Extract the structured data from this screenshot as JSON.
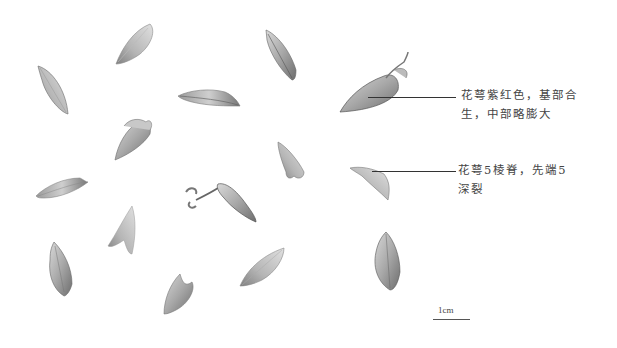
{
  "figure": {
    "annotations": [
      {
        "id": "a1",
        "line1": "花萼紫红色，基部合",
        "line2": "生，中部略膨大"
      },
      {
        "id": "a2",
        "line1": "花萼5棱脊，先端5",
        "line2": "深裂"
      }
    ],
    "scale_bar": {
      "label": "1cm"
    },
    "specimens": [
      {
        "name": "calyx-1"
      },
      {
        "name": "calyx-2"
      },
      {
        "name": "calyx-3"
      },
      {
        "name": "calyx-4"
      },
      {
        "name": "calyx-5"
      },
      {
        "name": "calyx-6"
      },
      {
        "name": "calyx-7"
      },
      {
        "name": "calyx-8"
      },
      {
        "name": "calyx-9"
      },
      {
        "name": "calyx-10"
      },
      {
        "name": "calyx-11"
      },
      {
        "name": "calyx-12"
      },
      {
        "name": "calyx-13"
      },
      {
        "name": "calyx-14"
      },
      {
        "name": "calyx-15"
      },
      {
        "name": "calyx-16"
      }
    ]
  }
}
